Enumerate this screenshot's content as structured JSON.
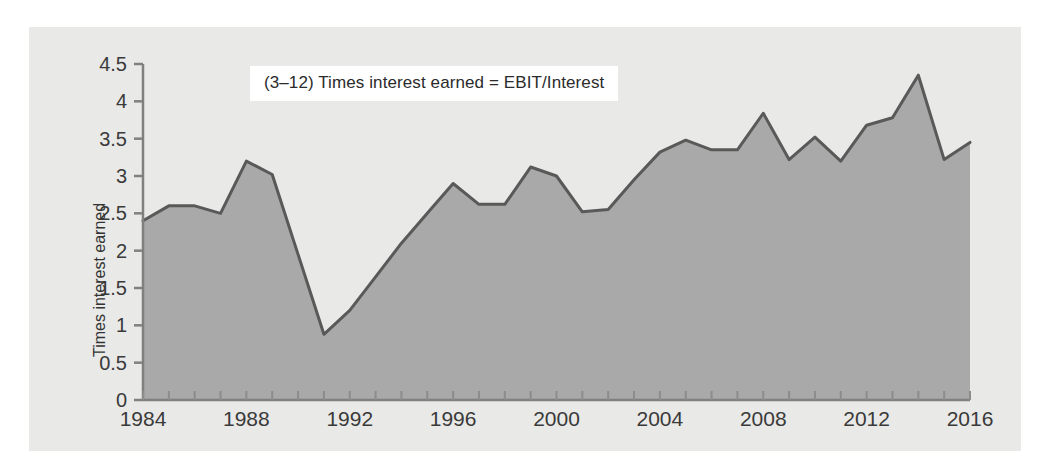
{
  "figure": {
    "background_color": "#e9e9e7",
    "page_color": "#ffffff"
  },
  "annotation": {
    "text": "(3–12) Times interest earned = EBIT/Interest",
    "box_color": "#ffffff",
    "text_color": "#2b2b2b"
  },
  "axis": {
    "y_label": "Times interest earned",
    "y_ticks": [
      "0",
      "0.5",
      "1",
      "1.5",
      "2",
      "2.5",
      "3",
      "3.5",
      "4",
      "4.5"
    ],
    "x_ticks": [
      "1984",
      "1988",
      "1992",
      "1996",
      "2000",
      "2004",
      "2008",
      "2012",
      "2016"
    ],
    "axis_color": "#808080",
    "tick_text_color": "#3a3a3a"
  },
  "chart_data": {
    "type": "area",
    "title": "(3–12) Times interest earned = EBIT/Interest",
    "xlabel": "",
    "ylabel": "Times interest earned",
    "xlim": [
      1984,
      2016
    ],
    "ylim": [
      0,
      4.5
    ],
    "ytick_step": 0.5,
    "xtick_step": 1,
    "xtick_label_step": 4,
    "grid": false,
    "legend": null,
    "line_color": "#595959",
    "fill_color": "#a9a9a9",
    "x": [
      1984,
      1985,
      1986,
      1987,
      1988,
      1989,
      1990,
      1991,
      1992,
      1993,
      1994,
      1995,
      1996,
      1997,
      1998,
      1999,
      2000,
      2001,
      2002,
      2003,
      2004,
      2005,
      2006,
      2007,
      2008,
      2009,
      2010,
      2011,
      2012,
      2013,
      2014,
      2015,
      2016
    ],
    "values": [
      2.4,
      2.6,
      2.6,
      2.5,
      3.2,
      3.02,
      1.95,
      0.88,
      1.2,
      1.65,
      2.1,
      2.5,
      2.9,
      2.62,
      2.62,
      3.12,
      3.0,
      2.52,
      2.55,
      2.95,
      3.32,
      3.48,
      3.35,
      3.35,
      3.84,
      3.22,
      3.52,
      3.2,
      3.68,
      3.78,
      4.35,
      3.22,
      3.45
    ],
    "series": [
      {
        "name": "Times interest earned",
        "values": [
          2.4,
          2.6,
          2.6,
          2.5,
          3.2,
          3.02,
          1.95,
          0.88,
          1.2,
          1.65,
          2.1,
          2.5,
          2.9,
          2.62,
          2.62,
          3.12,
          3.0,
          2.52,
          2.55,
          2.95,
          3.32,
          3.48,
          3.35,
          3.35,
          3.84,
          3.22,
          3.52,
          3.2,
          3.68,
          3.78,
          4.35,
          3.22,
          3.45
        ]
      }
    ]
  }
}
